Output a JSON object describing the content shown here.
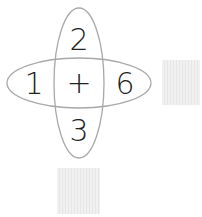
{
  "diagram": {
    "top": "2",
    "left": "1",
    "center": "+",
    "right": "6",
    "bottom": "3",
    "answer_boxes": [
      "right-blank",
      "bottom-blank"
    ],
    "ellipse_color": "#a8a8a8",
    "text_color": "#222222"
  }
}
